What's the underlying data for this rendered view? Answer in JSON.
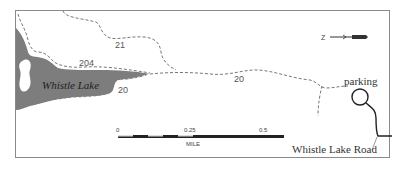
{
  "map": {
    "lake": {
      "name": "Whistle Lake",
      "fill_color": "#7d7d7d"
    },
    "trails": [
      {
        "number": "21",
        "style": "dashed"
      },
      {
        "number": "204",
        "style": "dashed"
      },
      {
        "number": "20",
        "style": "dashed",
        "label_positions": 2
      }
    ],
    "trail_labels": {
      "t21": "21",
      "t204": "204",
      "t20_lake": "20",
      "t20_mid": "20"
    },
    "places": {
      "parking": "parking",
      "road": "Whistle Lake Road"
    },
    "north_arrow": {
      "label": "Z",
      "orientation": "north points left"
    },
    "scale_bar": {
      "ticks": [
        "0",
        "0.25",
        "0.5"
      ],
      "unit": "MILE"
    },
    "colors": {
      "border": "#8a8a8a",
      "trail": "#666666",
      "road": "#222222",
      "lake": "#7d7d7d"
    }
  }
}
